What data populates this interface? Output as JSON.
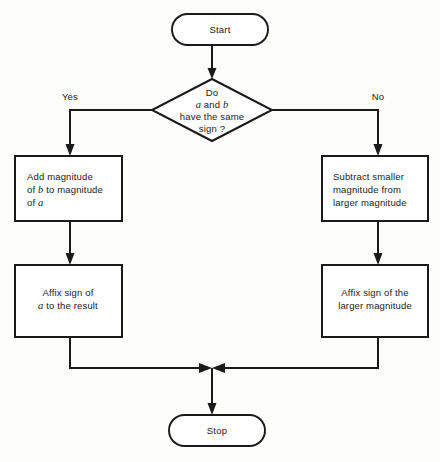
{
  "diagram": {
    "type": "flowchart",
    "background_color": "#fdfdfb",
    "line_color": "#1a1a1a",
    "fill_color": "#ffffff"
  },
  "nodes": {
    "start": {
      "shape": "terminal",
      "label": "Start"
    },
    "decision": {
      "shape": "diamond",
      "line1": "Do",
      "line2_pre": "",
      "line2_var1": "a",
      "line2_mid": " and ",
      "line2_var2": "b",
      "line3": "have the same",
      "line4": "sign ?"
    },
    "left_box_top": {
      "shape": "process",
      "line1": "Add magnitude",
      "line2_pre": "of ",
      "line2_var": "b",
      "line2_post": " to magnitude",
      "line3_pre": "of ",
      "line3_var": "a"
    },
    "right_box_top": {
      "shape": "process",
      "line1": "Subtract smaller",
      "line2": "magnitude from",
      "line3": "larger magnitude"
    },
    "left_box_bottom": {
      "shape": "process",
      "line1": "Affix sign of",
      "line2_var": "a",
      "line2_post": " to the result"
    },
    "right_box_bottom": {
      "shape": "process",
      "line1": "Affix sign of the",
      "line2": "larger magnitude"
    },
    "stop": {
      "shape": "terminal",
      "label": "Stop"
    }
  },
  "branch_labels": {
    "yes": "Yes",
    "no": "No"
  }
}
